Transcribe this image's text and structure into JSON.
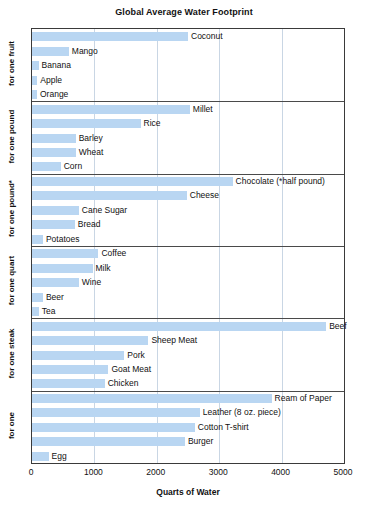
{
  "chart_data": {
    "type": "bar",
    "orientation": "horizontal",
    "title": "Global Average Water Footprint",
    "xlabel": "Quarts of Water",
    "ylabel": "",
    "xlim": [
      0,
      5000
    ],
    "xticks": [
      0,
      1000,
      2000,
      3000,
      4000,
      5000
    ],
    "xtick_labels": [
      "0",
      "1000",
      "2000",
      "3000",
      "4000",
      "5000"
    ],
    "grid": true,
    "legend": null,
    "bar_color": "#b9d6f2",
    "groups": [
      {
        "label": "for one fruit",
        "categories": [
          "Coconut",
          "Mango",
          "Banana",
          "Apple",
          "Orange"
        ],
        "values": [
          2500,
          590,
          105,
          85,
          80
        ]
      },
      {
        "label": "for one pound",
        "categories": [
          "Millet",
          "Rice",
          "Barley",
          "Wheat",
          "Corn"
        ],
        "values": [
          2530,
          1740,
          700,
          700,
          460
        ]
      },
      {
        "label": "for one pound*",
        "categories": [
          "Chocolate (*half pound)",
          "Cheese",
          "Cane Sugar",
          "Bread",
          "Potatoes"
        ],
        "values": [
          3215,
          2480,
          750,
          685,
          175
        ]
      },
      {
        "label": "for one quart",
        "categories": [
          "Coffee",
          "Milk",
          "Wine",
          "Beer",
          "Tea"
        ],
        "values": [
          1065,
          970,
          750,
          175,
          110
        ]
      },
      {
        "label": "for one steak",
        "categories": [
          "Beef",
          "Sheep Meat",
          "Pork",
          "Goat Meat",
          "Chicken"
        ],
        "values": [
          4715,
          1865,
          1480,
          1225,
          1165
        ]
      },
      {
        "label": "for one",
        "categories": [
          "Ream of Paper",
          "Leather (8 oz. piece)",
          "Cotton T-shirt",
          "Burger",
          "Egg"
        ],
        "values": [
          3840,
          2690,
          2610,
          2450,
          265
        ]
      }
    ]
  }
}
